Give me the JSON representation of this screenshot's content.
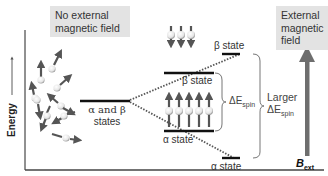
{
  "left_panel": {
    "title_line1": "No external",
    "title_line2": "magnetic field",
    "degenerate_label_line1": "α and β",
    "degenerate_label_line2": "states"
  },
  "right_panel": {
    "title_line1": "External",
    "title_line2": "magnetic",
    "title_line3": "field",
    "field_symbol": "B",
    "field_subscript": "ext"
  },
  "axis": {
    "ylabel": "Energy"
  },
  "levels": {
    "beta_small": "β state",
    "alpha_small": "α state",
    "beta_large": "β state",
    "alpha_large": "α state"
  },
  "gaps": {
    "small_prefix": "ΔE",
    "small_sub": "spin",
    "large_word": "Larger",
    "large_prefix": "ΔE",
    "large_sub": "spin"
  },
  "colors": {
    "arrow": "#555555",
    "box_bg": "#e3e3e3",
    "level_line": "#111111",
    "field_arrow": "#6e6e6e"
  }
}
